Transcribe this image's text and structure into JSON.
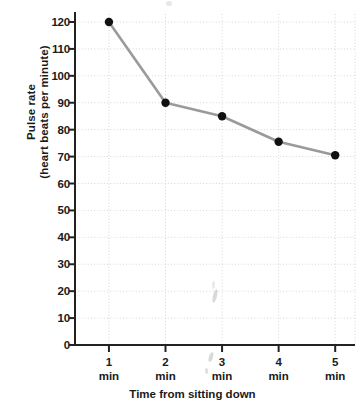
{
  "chart_data": {
    "type": "line",
    "title": "",
    "subtitle": "",
    "xlabel": "Time from sitting down",
    "ylabel": "Pulse rate (heart beats per minute)",
    "ylabel_lines": [
      "Pulse rate",
      "(heart beats per minute)"
    ],
    "categories": [
      "1 min",
      "2 min",
      "3 min",
      "4 min",
      "5 min"
    ],
    "x": [
      1,
      2,
      3,
      4,
      5
    ],
    "x_tick_numbers": [
      "1",
      "2",
      "3",
      "4",
      "5"
    ],
    "x_tick_units": [
      "min",
      "min",
      "min",
      "min",
      "min"
    ],
    "values": [
      120,
      90,
      85,
      75.5,
      70.5
    ],
    "series": [
      {
        "name": "Pulse rate",
        "values": [
          120,
          90,
          85,
          75.5,
          70.5
        ]
      }
    ],
    "ylim": [
      0,
      120
    ],
    "ytick_values": [
      0,
      10,
      20,
      30,
      40,
      50,
      60,
      70,
      80,
      90,
      100,
      110,
      120
    ],
    "ytick_labels": [
      "0",
      "10",
      "20",
      "30",
      "40",
      "50",
      "60",
      "70",
      "80",
      "90",
      "100",
      "110",
      "120"
    ],
    "xlim": [
      0.4,
      5.35
    ],
    "grid": "dotted-both-axes",
    "legend": "none",
    "line_color": "#9a9a9a",
    "marker_color": "#111111",
    "grid_color": "#d5d5d5",
    "axis_color": "#222222"
  }
}
